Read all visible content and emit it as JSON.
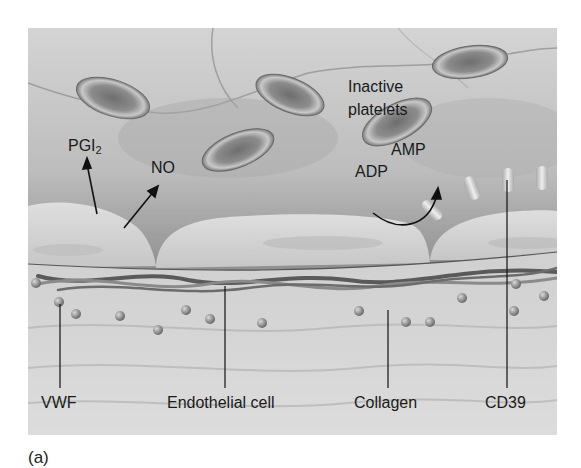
{
  "figure": {
    "panel_label": "(a)",
    "labels": {
      "inactive_platelets_line1": "Inactive",
      "inactive_platelets_line2": "platelets",
      "pgi2_main": "PGI",
      "pgi2_sub": "2",
      "no": "NO",
      "adp": "ADP",
      "amp": "AMP",
      "vwf": "VWF",
      "endothelial_cell": "Endothelial cell",
      "collagen": "Collagen",
      "cd39": "CD39"
    },
    "colors": {
      "lumen_light": "#d2d2d2",
      "lumen_dark": "#6e6e6e",
      "endothelium": "#cfcfcf",
      "subendothelium": "#d6d6d6",
      "platelet": "#8a8a8a",
      "text": "#1a1a1a"
    }
  }
}
